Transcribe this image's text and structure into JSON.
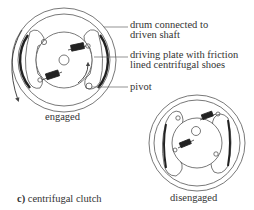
{
  "diagram": {
    "caption_prefix": "c)",
    "caption_text": "centrifugal clutch",
    "labels": [
      {
        "id": "drum",
        "line1": "drum connected to",
        "line2": "driven shaft"
      },
      {
        "id": "plate",
        "line1": "driving plate with friction",
        "line2": "lined centrifugal shoes"
      },
      {
        "id": "pivot",
        "line1": "pivot",
        "line2": ""
      }
    ],
    "states": {
      "engaged": "engaged",
      "disengaged": "disengaged"
    }
  }
}
